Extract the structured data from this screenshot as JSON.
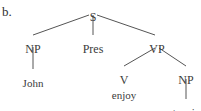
{
  "figure": {
    "item_label": "b.",
    "type": "syntax-tree",
    "sentence": "John Pres enjoy tennis",
    "colors": {
      "background": "#ffffff",
      "text": "#3b3b3b",
      "edge": "#555555"
    }
  },
  "tree": {
    "nodes": [
      {
        "id": "s",
        "label": "S",
        "kind": "category",
        "x": 93,
        "y": 11
      },
      {
        "id": "np1",
        "label": "NP",
        "kind": "category",
        "x": 33,
        "y": 43
      },
      {
        "id": "pres",
        "label": "Pres",
        "kind": "category",
        "x": 93,
        "y": 43
      },
      {
        "id": "vp",
        "label": "VP",
        "kind": "category",
        "x": 157,
        "y": 43
      },
      {
        "id": "john",
        "label": "John",
        "kind": "terminal",
        "x": 33,
        "y": 78
      },
      {
        "id": "v",
        "label": "V",
        "kind": "category",
        "x": 124,
        "y": 74
      },
      {
        "id": "np2",
        "label": "NP",
        "kind": "category",
        "x": 186,
        "y": 74
      },
      {
        "id": "enjoy",
        "label": "enjoy",
        "kind": "terminal",
        "x": 124,
        "y": 90
      },
      {
        "id": "tennis",
        "label": "tennis",
        "kind": "terminal",
        "x": 186,
        "y": 107
      }
    ],
    "edges": [
      {
        "from": "s",
        "to": "np1",
        "x1": 89,
        "y1": 15,
        "x2": 33,
        "y2": 35
      },
      {
        "from": "s",
        "to": "pres",
        "x1": 93,
        "y1": 15,
        "x2": 93,
        "y2": 35
      },
      {
        "from": "s",
        "to": "vp",
        "x1": 97,
        "y1": 15,
        "x2": 155,
        "y2": 35
      },
      {
        "from": "np1",
        "to": "john",
        "x1": 33,
        "y1": 47,
        "x2": 33,
        "y2": 69
      },
      {
        "from": "vp",
        "to": "v",
        "x1": 155,
        "y1": 48,
        "x2": 124,
        "y2": 66
      },
      {
        "from": "vp",
        "to": "np2",
        "x1": 159,
        "y1": 48,
        "x2": 186,
        "y2": 66
      },
      {
        "from": "np2",
        "to": "tennis",
        "x1": 186,
        "y1": 79,
        "x2": 186,
        "y2": 99
      }
    ]
  }
}
